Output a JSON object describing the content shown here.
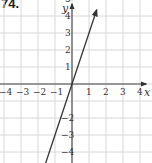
{
  "problem": {
    "number": "74."
  },
  "chart_data": {
    "type": "line",
    "title": "",
    "xlabel": "x",
    "ylabel": "y",
    "xlim": [
      -5.5,
      5.5
    ],
    "ylim": [
      -5.5,
      5.5
    ],
    "grid": true,
    "x_tick_labels": [
      "-5",
      "-4",
      "-3",
      "-2",
      "-1",
      "1",
      "2",
      "3",
      "4",
      "5"
    ],
    "y_tick_labels": [
      "5",
      "4",
      "3",
      "2",
      "1",
      "-2",
      "-3",
      "-4",
      "-5"
    ],
    "series": [
      {
        "name": "y = 3x",
        "equation": "y = 3x",
        "x": [
          -1.75,
          1.45
        ],
        "y": [
          -5.25,
          4.35
        ],
        "color": "#333333",
        "arrows_both_ends": true
      }
    ]
  },
  "colors": {
    "grid": "#d8d8d8",
    "axis": "#444444",
    "line": "#333333"
  }
}
